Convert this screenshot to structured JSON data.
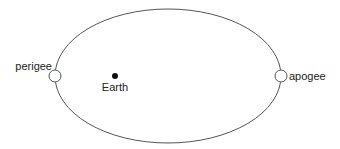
{
  "diagram": {
    "type": "orbit",
    "orbit": {
      "cx": 168,
      "cy": 76,
      "rx": 113,
      "ry": 67,
      "stroke": "#555555"
    },
    "body": {
      "label": "Earth",
      "x": 115,
      "y": 76,
      "r": 3,
      "color": "#111111"
    },
    "points": [
      {
        "id": "perigee",
        "label": "perigee",
        "x": 55,
        "y": 76,
        "r": 6
      },
      {
        "id": "apogee",
        "label": "apogee",
        "x": 281,
        "y": 76,
        "r": 6
      }
    ]
  }
}
